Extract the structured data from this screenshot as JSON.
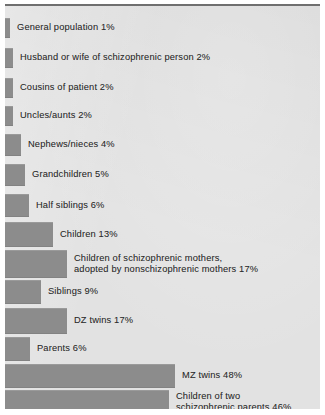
{
  "figure": {
    "background_color": "#e2e2e2",
    "bar_color": "#8c8c8c",
    "text_color": "#2c2c2c",
    "page_color": "#ffffff"
  },
  "chart_data": {
    "type": "bar",
    "orientation": "horizontal",
    "title": "",
    "subtitle": "",
    "xlabel": "",
    "ylabel": "",
    "grid": false,
    "legend": false,
    "xlim": [
      0,
      50
    ],
    "value_unit": "%",
    "categories": [
      "General population",
      "Husband or wife of schizophrenic person",
      "Cousins of patient",
      "Uncles/aunts",
      "Nephews/nieces",
      "Grandchildren",
      "Half siblings",
      "Children",
      "Children of schizophrenic mothers,\nadopted by nonschizophrenic mothers",
      "Siblings",
      "DZ twins",
      "Parents",
      "MZ twins",
      "Children of two\nschizophrenic parents"
    ],
    "values": [
      1,
      2,
      2,
      2,
      4,
      5,
      6,
      13,
      17,
      9,
      17,
      6,
      48,
      46
    ],
    "bars": [
      {
        "label": "General population 1%",
        "category": "General population",
        "value": 1,
        "top": 12,
        "height": 20,
        "bar_width": 5
      },
      {
        "label": "Husband or wife of schizophrenic person 2%",
        "category": "Husband or wife of schizophrenic person",
        "value": 2,
        "top": 42,
        "height": 20,
        "bar_width": 8
      },
      {
        "label": "Cousins of patient 2%",
        "category": "Cousins of patient",
        "value": 2,
        "top": 72,
        "height": 20,
        "bar_width": 8
      },
      {
        "label": "Uncles/aunts 2%",
        "category": "Uncles/aunts",
        "value": 2,
        "top": 100,
        "height": 20,
        "bar_width": 8
      },
      {
        "label": "Nephews/nieces 4%",
        "category": "Nephews/nieces",
        "value": 4,
        "top": 128,
        "height": 22,
        "bar_width": 16
      },
      {
        "label": "Grandchildren 5%",
        "category": "Grandchildren",
        "value": 5,
        "top": 158,
        "height": 22,
        "bar_width": 20
      },
      {
        "label": "Half siblings 6%",
        "category": "Half siblings",
        "value": 6,
        "top": 188,
        "height": 23,
        "bar_width": 24
      },
      {
        "label": "Children 13%",
        "category": "Children",
        "value": 13,
        "top": 216,
        "height": 25,
        "bar_width": 48
      },
      {
        "label": "Children of schizophrenic mothers,\nadopted by nonschizophrenic mothers 17%",
        "category": "Children of schizophrenic mothers, adopted by nonschizophrenic mothers",
        "value": 17,
        "top": 244,
        "height": 28,
        "bar_width": 62
      },
      {
        "label": "Siblings 9%",
        "category": "Siblings",
        "value": 9,
        "top": 274,
        "height": 24,
        "bar_width": 36
      },
      {
        "label": "DZ twins 17%",
        "category": "DZ twins",
        "value": 17,
        "top": 302,
        "height": 26,
        "bar_width": 62
      },
      {
        "label": "Parents 6%",
        "category": "Parents",
        "value": 6,
        "top": 331,
        "height": 24,
        "bar_width": 25
      },
      {
        "label": "MZ twins 48%",
        "category": "MZ twins",
        "value": 48,
        "top": 358,
        "height": 24,
        "bar_width": 170
      },
      {
        "label": "Children of two\nschizophrenic parents 46%",
        "category": "Children of two schizophrenic parents",
        "value": 46,
        "top": 384,
        "height": 24,
        "bar_width": 164
      }
    ]
  }
}
